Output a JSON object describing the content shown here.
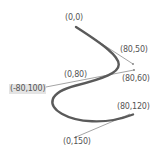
{
  "diagram": {
    "colors": {
      "curve": "#555555",
      "tangent": "#999999",
      "label": "#555555",
      "highlight_bg": "#e4e4e4"
    },
    "points": [
      {
        "id": "p0",
        "label": "(0,0)",
        "x": 0,
        "y": 0,
        "role": "anchor"
      },
      {
        "id": "c1",
        "label": "(80,50)",
        "x": 80,
        "y": 50,
        "role": "control"
      },
      {
        "id": "c2",
        "label": "(80,60)",
        "x": 80,
        "y": 60,
        "role": "control"
      },
      {
        "id": "p1",
        "label": "(0,80)",
        "x": 0,
        "y": 80,
        "role": "anchor"
      },
      {
        "id": "c3",
        "label": "(-80,100)",
        "x": -80,
        "y": 100,
        "role": "control",
        "highlighted": true
      },
      {
        "id": "p2",
        "label": "(80,120)",
        "x": 80,
        "y": 120,
        "role": "anchor"
      },
      {
        "id": "c4",
        "label": "(0,150)",
        "x": 0,
        "y": 150,
        "role": "control"
      }
    ]
  }
}
